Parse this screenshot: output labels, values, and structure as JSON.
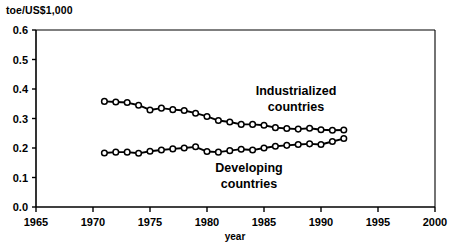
{
  "chart_data": {
    "type": "line",
    "title": "",
    "subtitle": "",
    "unit_label": "toe/US$1,000",
    "xlabel": "year",
    "ylabel": "",
    "xlim": [
      1965,
      2000
    ],
    "ylim": [
      0.0,
      0.6
    ],
    "xticks": [
      1965,
      1970,
      1975,
      1980,
      1985,
      1990,
      1995,
      2000
    ],
    "yticks": [
      "0.0",
      "0.1",
      "0.2",
      "0.3",
      "0.4",
      "0.5",
      "0.6"
    ],
    "grid": false,
    "legend_position": "inline-annotation",
    "marker": "open-circle",
    "x": [
      1971,
      1972,
      1973,
      1974,
      1975,
      1976,
      1977,
      1978,
      1979,
      1980,
      1981,
      1982,
      1983,
      1984,
      1985,
      1986,
      1987,
      1988,
      1989,
      1990,
      1991,
      1992
    ],
    "series": [
      {
        "name": "Industrialized countries",
        "values": [
          0.358,
          0.356,
          0.354,
          0.345,
          0.329,
          0.335,
          0.33,
          0.327,
          0.318,
          0.307,
          0.293,
          0.288,
          0.28,
          0.28,
          0.277,
          0.269,
          0.266,
          0.264,
          0.267,
          0.262,
          0.26,
          0.261
        ]
      },
      {
        "name": "Developing countries",
        "values": [
          0.183,
          0.186,
          0.186,
          0.182,
          0.189,
          0.193,
          0.197,
          0.2,
          0.204,
          0.188,
          0.186,
          0.191,
          0.196,
          0.193,
          0.2,
          0.206,
          0.209,
          0.212,
          0.214,
          0.212,
          0.222,
          0.232
        ]
      }
    ],
    "annotations": [
      {
        "text_line1": "Industrialized",
        "text_line2": "countries"
      },
      {
        "text_line1": "Developing",
        "text_line2": "countries"
      }
    ],
    "colors": {
      "line": "#000000",
      "marker_fill": "#ffffff",
      "background": "#ffffff"
    }
  }
}
